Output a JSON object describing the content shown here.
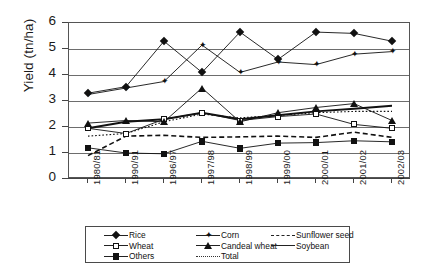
{
  "chart_data": {
    "type": "line",
    "title": "",
    "xlabel": "",
    "ylabel": "Yield (tn/ha)",
    "ylim": [
      0,
      6
    ],
    "yticks": [
      0,
      1,
      2,
      3,
      4,
      5,
      6
    ],
    "grid": true,
    "legend_position": "bottom",
    "categories": [
      "1980/81",
      "1990/91",
      "1996/97",
      "1997/98",
      "1998/99",
      "1999/00",
      "2000/01",
      "2001/02",
      "2002/03"
    ],
    "series": [
      {
        "name": "Rice",
        "marker": "filled-diamond",
        "line": "solid",
        "values": [
          3.3,
          3.55,
          5.3,
          4.1,
          5.65,
          4.6,
          5.65,
          5.6,
          5.3
        ]
      },
      {
        "name": "Wheat",
        "marker": "open-square",
        "line": "solid",
        "values": [
          1.95,
          1.75,
          2.3,
          2.55,
          2.25,
          2.4,
          2.5,
          2.1,
          1.95
        ]
      },
      {
        "name": "Others",
        "marker": "filled-square",
        "line": "solid",
        "values": [
          1.2,
          1.0,
          0.97,
          1.45,
          1.18,
          1.38,
          1.4,
          1.47,
          1.43
        ]
      },
      {
        "name": "Corn",
        "marker": "filled-star",
        "line": "solid",
        "values": [
          3.25,
          3.5,
          3.75,
          5.15,
          4.1,
          4.5,
          4.4,
          4.8,
          4.9
        ]
      },
      {
        "name": "Candeal wheat",
        "marker": "filled-triangle",
        "line": "solid",
        "values": [
          2.15,
          2.25,
          2.2,
          3.5,
          2.2,
          2.55,
          2.75,
          2.9,
          2.25
        ]
      },
      {
        "name": "Total",
        "marker": "none",
        "line": "dotted",
        "values": [
          1.65,
          1.75,
          2.2,
          2.5,
          2.35,
          2.45,
          2.55,
          2.6,
          2.6
        ]
      },
      {
        "name": "Sunflower seed",
        "marker": "none",
        "line": "dashed",
        "values": [
          0.9,
          1.65,
          1.68,
          1.6,
          1.62,
          1.65,
          1.6,
          1.8,
          1.6
        ]
      },
      {
        "name": "Soybean",
        "marker": "none",
        "line": "thick-solid",
        "values": [
          1.95,
          2.2,
          2.3,
          2.55,
          2.3,
          2.45,
          2.6,
          2.7,
          2.82
        ]
      }
    ]
  },
  "legend": {
    "columns": [
      {
        "items": [
          {
            "label": "Rice",
            "key": "filled-diamond"
          },
          {
            "label": "Wheat",
            "key": "open-square"
          },
          {
            "label": "Others",
            "key": "filled-square"
          }
        ]
      },
      {
        "items": [
          {
            "label": "Corn",
            "key": "filled-star"
          },
          {
            "label": "Candeal wheat",
            "key": "filled-triangle"
          },
          {
            "label": "Total",
            "key": "dotted-line"
          }
        ]
      },
      {
        "items": [
          {
            "label": "Sunflower seed",
            "key": "dashed-line"
          },
          {
            "label": "Soybean",
            "key": "solid-line"
          }
        ]
      }
    ]
  },
  "colors": {
    "line": "#111111",
    "grid": "#6d6d6d",
    "axis": "#444444",
    "text": "#1a1a1a"
  }
}
